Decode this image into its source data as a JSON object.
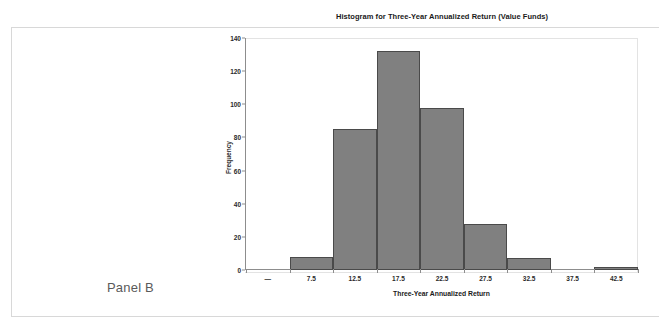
{
  "panel": {
    "caption": "Panel B"
  },
  "chart_data": {
    "type": "bar",
    "title": "Histogram for Three-Year Annualized Return (Value Funds)",
    "xlabel": "Three-Year Annualized Return",
    "ylabel": "Frequency",
    "categories": [
      "—",
      "7.5",
      "12.5",
      "17.5",
      "22.5",
      "27.5",
      "32.5",
      "37.5",
      "42.5"
    ],
    "values": [
      0,
      8,
      85,
      132,
      98,
      28,
      7,
      0,
      2
    ],
    "ylim": [
      0,
      140
    ],
    "yticks": [
      0,
      20,
      40,
      60,
      80,
      100,
      120,
      140
    ],
    "ytick_labels": [
      "0",
      "20",
      "40",
      "60",
      "80",
      "100",
      "120",
      "140"
    ],
    "grid": false,
    "legend": "none",
    "bar_color": "#808080",
    "bar_edge_color": "#4a4a4a",
    "axis_color": "#8d8d8d",
    "frame_color": "#e3e3e3"
  }
}
